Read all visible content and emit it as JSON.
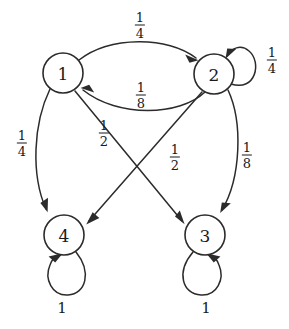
{
  "diagram": {
    "type": "markov-chain-state-diagram",
    "title": "",
    "stroke_color": "#2b2b2b",
    "text_color": "#1a1a1a",
    "background_color": "#ffffff",
    "nodes": [
      {
        "id": "1",
        "label": "1",
        "cx": 63,
        "cy": 73,
        "r": 20
      },
      {
        "id": "2",
        "label": "2",
        "cx": 214,
        "cy": 74,
        "r": 20
      },
      {
        "id": "3",
        "label": "3",
        "cx": 205,
        "cy": 235,
        "r": 20
      },
      {
        "id": "4",
        "label": "4",
        "cx": 64,
        "cy": 235,
        "r": 20
      }
    ],
    "edges": [
      {
        "from": "1",
        "to": "2",
        "label": "1/4",
        "numerator": "1",
        "denominator": "4",
        "shape": "arc-top",
        "label_x": 140,
        "label_y": 25
      },
      {
        "from": "2",
        "to": "1",
        "label": "1/8",
        "numerator": "1",
        "denominator": "8",
        "shape": "arc-bottom",
        "label_x": 141,
        "label_y": 95
      },
      {
        "from": "2",
        "to": "2",
        "label": "1/4",
        "numerator": "1",
        "denominator": "4",
        "shape": "self-loop-right",
        "label_x": 272,
        "label_y": 60
      },
      {
        "from": "1",
        "to": "4",
        "label": "1/4",
        "numerator": "1",
        "denominator": "4",
        "shape": "curve-left",
        "label_x": 22,
        "label_y": 143
      },
      {
        "from": "1",
        "to": "3",
        "label": "1/2",
        "numerator": "1",
        "denominator": "2",
        "shape": "diagonal",
        "label_x": 175,
        "label_y": 157
      },
      {
        "from": "2",
        "to": "4",
        "label": "1/2",
        "numerator": "1",
        "denominator": "2",
        "shape": "diagonal",
        "label_x": 104,
        "label_y": 133
      },
      {
        "from": "2",
        "to": "3",
        "label": "1/8",
        "numerator": "1",
        "denominator": "8",
        "shape": "curve-right",
        "label_x": 247,
        "label_y": 155
      },
      {
        "from": "4",
        "to": "4",
        "label": "1",
        "numerator": "1",
        "denominator": "",
        "shape": "self-loop-down",
        "label_x": 62,
        "label_y": 308
      },
      {
        "from": "3",
        "to": "3",
        "label": "1",
        "numerator": "1",
        "denominator": "",
        "shape": "self-loop-down",
        "label_x": 206,
        "label_y": 308
      }
    ],
    "labels": {
      "edge_1_to_2": {
        "num": "1",
        "den": "4"
      },
      "edge_2_to_1": {
        "num": "1",
        "den": "8"
      },
      "edge_2_self": {
        "num": "1",
        "den": "4"
      },
      "edge_1_to_4": {
        "num": "1",
        "den": "4"
      },
      "edge_2_to_4": {
        "num": "1",
        "den": "2"
      },
      "edge_1_to_3": {
        "num": "1",
        "den": "2"
      },
      "edge_2_to_3": {
        "num": "1",
        "den": "8"
      },
      "edge_4_self": {
        "whole": "1"
      },
      "edge_3_self": {
        "whole": "1"
      }
    },
    "node_labels": {
      "n1": "1",
      "n2": "2",
      "n3": "3",
      "n4": "4"
    }
  }
}
